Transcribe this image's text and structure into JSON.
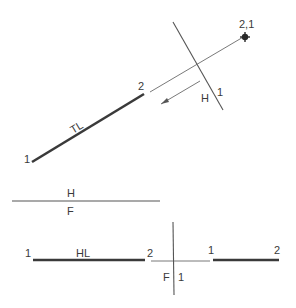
{
  "diagram": {
    "colors": {
      "line": "#3a3a3a",
      "thin": "#6a6a6a",
      "background": "#ffffff"
    },
    "auxiliary_view": {
      "point_view_label": "2,1",
      "true_length_label": "TL",
      "end_label_1": "1",
      "end_label_2": "2",
      "fold_line_labels": {
        "side_a": "H",
        "side_b": "1"
      }
    },
    "fold_line_hf": {
      "top_label": "H",
      "bottom_label": "F"
    },
    "front_view": {
      "horizontal_line_label": "HL",
      "end_label_1": "1",
      "end_label_2": "2"
    },
    "fold_line_f1": {
      "left_label": "F",
      "right_label": "1"
    },
    "side_view": {
      "end_label_1": "1",
      "end_label_2": "2"
    }
  }
}
